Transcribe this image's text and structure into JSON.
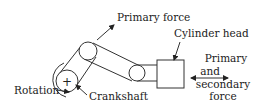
{
  "diagram": {
    "labels": {
      "primary_force": "Primary force",
      "cylinder_head": "Cylinder head",
      "force_line1": "Primary",
      "force_line2": "and",
      "force_line3": "secondary",
      "force_line4": "force",
      "rotation": "Rotation",
      "crankshaft": "Crankshaft",
      "crankshaft_center_symbol": "+"
    },
    "colors": {
      "stroke": "#333333",
      "text": "#222222",
      "background": "#ffffff"
    }
  }
}
